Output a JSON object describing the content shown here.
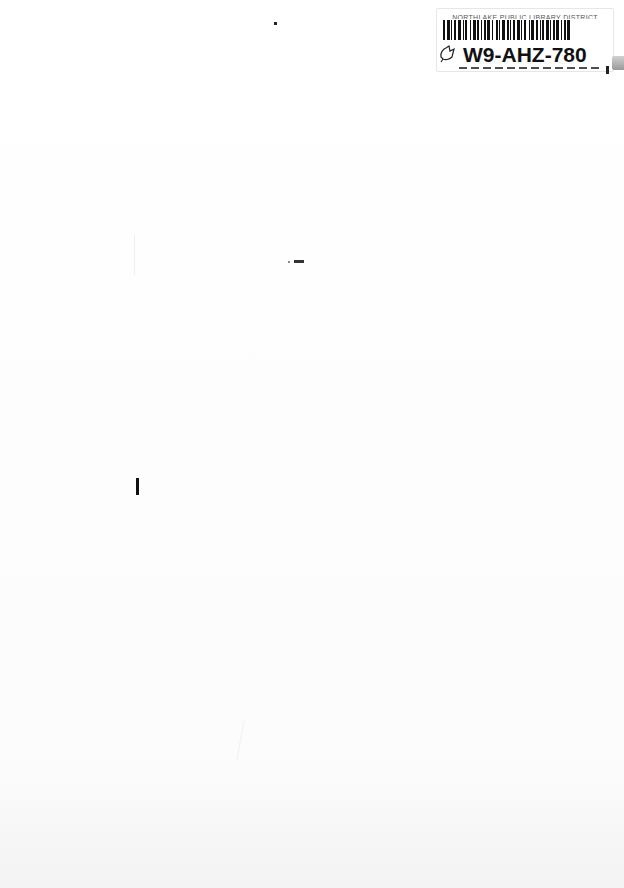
{
  "document": {
    "type": "scanned blank page",
    "library_label": {
      "institution": "NORTHLAKE PUBLIC LIBRARY DISTRICT",
      "call_number": "W9-AHZ-780",
      "barcode_number_partial": "3 1185 00 ... 22",
      "icon": "bookmark-leaf-icon"
    }
  }
}
